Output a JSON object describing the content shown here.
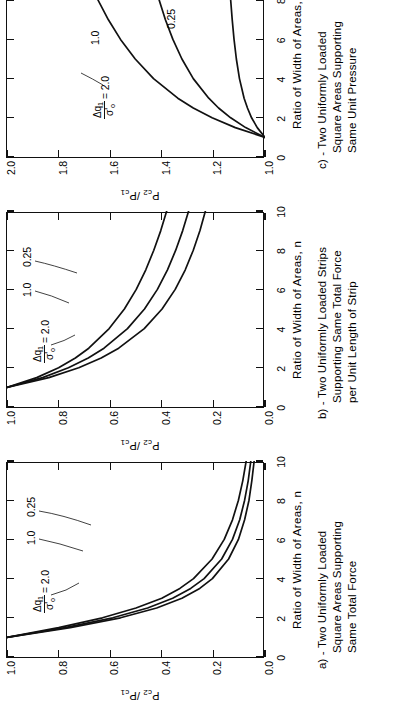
{
  "figure": {
    "orientation": "rotated-90-ccw",
    "line_color": "#111111",
    "background": "#ffffff"
  },
  "axis": {
    "xlabel": "Ratio of Width of Areas, n",
    "ylabel_prefix": "P",
    "ylabel_sub1": "c",
    "ylabel_sub2": "2",
    "ylabel_slash": "/P",
    "ylabel_sub3": "c",
    "ylabel_sub4": "1",
    "ylabel_plain": "Pc2 /Pc1"
  },
  "annotation": {
    "numerator": "Δq",
    "numerator_sub": "1",
    "denominator": "σ'",
    "denominator_sub": "o",
    "equals": "= 2.0"
  },
  "panels": [
    {
      "id": "a",
      "caption_lines": [
        "a) - Two Uniformly Loaded",
        "Square Areas Supporting",
        "Same Total Force"
      ],
      "ylim": [
        0.0,
        1.0
      ],
      "yticks": [
        "1.0",
        "0.8",
        "0.6",
        "0.4",
        "0.2",
        "0.0"
      ],
      "ytick_values": [
        1.0,
        0.8,
        0.6,
        0.4,
        0.2,
        0.0
      ],
      "xlim": [
        0,
        10
      ],
      "xticks": [
        "0",
        "2",
        "4",
        "6",
        "8",
        "10"
      ],
      "xtick_values": [
        0,
        2,
        4,
        6,
        8,
        10
      ],
      "curve_labels": [
        "2.0",
        "1.0",
        "0.25"
      ]
    },
    {
      "id": "b",
      "caption_lines": [
        "b) - Two Uniformly Loaded Strips",
        "Supporting Same Total Force",
        "per Unit Length of Strip"
      ],
      "ylim": [
        0.0,
        1.0
      ],
      "yticks": [
        "1.0",
        "0.8",
        "0.6",
        "0.4",
        "0.2",
        "0.0"
      ],
      "ytick_values": [
        1.0,
        0.8,
        0.6,
        0.4,
        0.2,
        0.0
      ],
      "xlim": [
        0,
        10
      ],
      "xticks": [
        "0",
        "2",
        "4",
        "6",
        "8",
        "10"
      ],
      "xtick_values": [
        0,
        2,
        4,
        6,
        8,
        10
      ],
      "curve_labels": [
        "2.0",
        "1.0",
        "0.25"
      ]
    },
    {
      "id": "c",
      "caption_lines": [
        "c) - Two Uniformly Loaded",
        "Square Areas Supporting",
        "Same Unit Pressure"
      ],
      "ylim": [
        1.0,
        2.0
      ],
      "yticks": [
        "2.0",
        "1.8",
        "1.6",
        "1.4",
        "1.2",
        "1.0"
      ],
      "ytick_values": [
        2.0,
        1.8,
        1.6,
        1.4,
        1.2,
        1.0
      ],
      "xlim": [
        0,
        10
      ],
      "xticks": [
        "0",
        "2",
        "4",
        "6",
        "8",
        "10"
      ],
      "xtick_values": [
        0,
        2,
        4,
        6,
        8,
        10
      ],
      "curve_labels": [
        "2.0",
        "1.0",
        "0.25"
      ]
    }
  ],
  "chart_data": [
    {
      "type": "line",
      "panel": "a",
      "title": "a) - Two Uniformly Loaded Square Areas Supporting Same Total Force",
      "xlabel": "Ratio of Width of Areas, n",
      "ylabel": "Pc2 /Pc1",
      "xlim": [
        0,
        10
      ],
      "ylim": [
        0.0,
        1.0
      ],
      "grid": false,
      "legend": "inline-curve-labels",
      "x": [
        1,
        1.5,
        2,
        2.5,
        3,
        3.5,
        4,
        5,
        6,
        7,
        8,
        9,
        10
      ],
      "series": [
        {
          "name": "2.0",
          "values": [
            1.0,
            0.8,
            0.63,
            0.5,
            0.4,
            0.33,
            0.277,
            0.205,
            0.158,
            0.126,
            0.103,
            0.086,
            0.073
          ]
        },
        {
          "name": "1.0",
          "values": [
            1.0,
            0.775,
            0.59,
            0.455,
            0.358,
            0.288,
            0.236,
            0.168,
            0.126,
            0.098,
            0.079,
            0.065,
            0.055
          ]
        },
        {
          "name": "0.25",
          "values": [
            1.0,
            0.755,
            0.56,
            0.42,
            0.322,
            0.253,
            0.204,
            0.141,
            0.103,
            0.079,
            0.062,
            0.051,
            0.042
          ]
        }
      ]
    },
    {
      "type": "line",
      "panel": "b",
      "title": "b) - Two Uniformly Loaded Strips Supporting Same Total Force per Unit Length of Strip",
      "xlabel": "Ratio of Width of Areas, n",
      "ylabel": "Pc2 /Pc1",
      "xlim": [
        0,
        10
      ],
      "ylim": [
        0.0,
        1.0
      ],
      "grid": false,
      "legend": "inline-curve-labels",
      "x": [
        1,
        1.5,
        2,
        2.5,
        3,
        4,
        5,
        6,
        7,
        8,
        9,
        10
      ],
      "series": [
        {
          "name": "2.0",
          "values": [
            1.0,
            0.885,
            0.8,
            0.735,
            0.683,
            0.604,
            0.545,
            0.499,
            0.462,
            0.431,
            0.404,
            0.381
          ]
        },
        {
          "name": "1.0",
          "values": [
            1.0,
            0.862,
            0.762,
            0.685,
            0.624,
            0.533,
            0.467,
            0.417,
            0.378,
            0.346,
            0.319,
            0.296
          ]
        },
        {
          "name": "0.25",
          "values": [
            1.0,
            0.838,
            0.722,
            0.635,
            0.567,
            0.468,
            0.399,
            0.348,
            0.309,
            0.278,
            0.252,
            0.231
          ]
        }
      ]
    },
    {
      "type": "line",
      "panel": "c",
      "title": "c) - Two Uniformly Loaded Square Areas Supporting Same Unit Pressure",
      "xlabel": "Ratio of Width of Areas, n",
      "ylabel": "Pc2 /Pc1",
      "xlim": [
        0,
        10
      ],
      "ylim": [
        1.0,
        2.0
      ],
      "grid": false,
      "legend": "inline-curve-labels",
      "x": [
        1,
        1.5,
        2,
        2.5,
        3,
        4,
        5,
        6,
        7,
        8,
        9,
        10
      ],
      "series": [
        {
          "name": "2.0",
          "values": [
            1.0,
            1.115,
            1.205,
            1.278,
            1.338,
            1.432,
            1.503,
            1.56,
            1.607,
            1.647,
            1.682,
            1.713
          ]
        },
        {
          "name": "1.0",
          "values": [
            1.0,
            1.075,
            1.133,
            1.18,
            1.218,
            1.278,
            1.322,
            1.357,
            1.386,
            1.41,
            1.431,
            1.449
          ]
        },
        {
          "name": "0.25",
          "values": [
            1.0,
            1.03,
            1.052,
            1.068,
            1.081,
            1.099,
            1.111,
            1.12,
            1.127,
            1.133,
            1.138,
            1.142
          ]
        }
      ]
    }
  ]
}
